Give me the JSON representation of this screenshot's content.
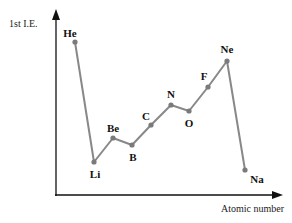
{
  "chart_data": {
    "type": "line",
    "title": "",
    "xlabel": "Atomic number",
    "ylabel": "1st I.E.",
    "grid": false,
    "legend": null,
    "units": "arbitrary (relative, no tick values shown)",
    "categories": [
      "He",
      "Li",
      "Be",
      "B",
      "C",
      "N",
      "O",
      "F",
      "Ne",
      "Na"
    ],
    "series": [
      {
        "name": "1st I.E.",
        "values": [
          153,
          33,
          57,
          50,
          70,
          90,
          84,
          108,
          134,
          25
        ]
      }
    ],
    "points": [
      {
        "label": "He",
        "x": 75,
        "y": 42,
        "lx": 70,
        "ly": 33,
        "value": 153
      },
      {
        "label": "Li",
        "x": 94,
        "y": 162,
        "lx": 95,
        "ly": 174,
        "value": 33
      },
      {
        "label": "Be",
        "x": 113,
        "y": 138,
        "lx": 113,
        "ly": 128,
        "value": 57
      },
      {
        "label": "B",
        "x": 132,
        "y": 145,
        "lx": 133,
        "ly": 157,
        "value": 50
      },
      {
        "label": "C",
        "x": 151,
        "y": 125,
        "lx": 146,
        "ly": 116,
        "value": 70
      },
      {
        "label": "N",
        "x": 171,
        "y": 105,
        "lx": 171,
        "ly": 94,
        "value": 90
      },
      {
        "label": "O",
        "x": 189,
        "y": 111,
        "lx": 189,
        "ly": 123,
        "value": 84
      },
      {
        "label": "F",
        "x": 208,
        "y": 87,
        "lx": 204,
        "ly": 76,
        "value": 108
      },
      {
        "label": "Ne",
        "x": 227,
        "y": 61,
        "lx": 227,
        "ly": 49,
        "value": 134
      },
      {
        "label": "Na",
        "x": 245,
        "y": 170,
        "lx": 257,
        "ly": 179,
        "value": 25
      }
    ]
  },
  "colors": {
    "line": "#888888",
    "marker": "#7a7a7a",
    "axis": "#111111",
    "text": "#111111"
  }
}
